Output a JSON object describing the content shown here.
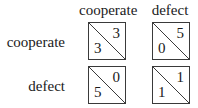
{
  "game": {
    "title": "Prisoner's Dilemma payoff matrix",
    "column_strategies": [
      "cooperate",
      "defect"
    ],
    "row_strategies": [
      "cooperate",
      "defect"
    ],
    "cells": [
      [
        {
          "row_payoff": "3",
          "col_payoff": "3"
        },
        {
          "row_payoff": "0",
          "col_payoff": "5"
        }
      ],
      [
        {
          "row_payoff": "5",
          "col_payoff": "0"
        },
        {
          "row_payoff": "1",
          "col_payoff": "1"
        }
      ]
    ]
  }
}
